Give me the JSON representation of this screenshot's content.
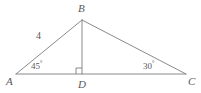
{
  "figure": {
    "type": "geometry-diagram",
    "shape": "triangle-with-altitude",
    "background_color": "#ffffff",
    "stroke_color": "#7d7d80",
    "text_color": "#58585a",
    "vertices": [
      {
        "name": "A",
        "label": "A",
        "x": 16,
        "y": 74,
        "label_x": 7,
        "label_y": 76
      },
      {
        "name": "B",
        "label": "B",
        "x": 82,
        "y": 20,
        "label_x": 78,
        "label_y": 4
      },
      {
        "name": "C",
        "label": "C",
        "x": 186,
        "y": 74,
        "label_x": 188,
        "label_y": 76
      },
      {
        "name": "D",
        "label": "D",
        "x": 82,
        "y": 74,
        "label_x": 78,
        "label_y": 79
      }
    ],
    "segments": [
      {
        "name": "segment-AC",
        "from": "A",
        "to": "C",
        "x1": 16,
        "y1": 74,
        "x2": 186,
        "y2": 74
      },
      {
        "name": "segment-AB",
        "from": "A",
        "to": "B",
        "x1": 16,
        "y1": 74,
        "x2": 82,
        "y2": 20
      },
      {
        "name": "segment-BC",
        "from": "B",
        "to": "C",
        "x1": 82,
        "y1": 20,
        "x2": 186,
        "y2": 74
      },
      {
        "name": "segment-BD-altitude",
        "from": "B",
        "to": "D",
        "x1": 82,
        "y1": 20,
        "x2": 82,
        "y2": 74
      }
    ],
    "side_labels": [
      {
        "name": "side-AB-length",
        "text": "4",
        "x": 36,
        "y": 35
      }
    ],
    "angle_labels": [
      {
        "name": "angle-A",
        "value": "45",
        "degree_symbol": "°",
        "x": 31,
        "y": 62
      },
      {
        "name": "angle-C",
        "value": "30",
        "degree_symbol": "°",
        "x": 143,
        "y": 62
      }
    ],
    "right_angle_mark": {
      "name": "right-angle-mark-D",
      "at_vertex": "D",
      "x": 76,
      "y": 68,
      "size": 6
    }
  }
}
